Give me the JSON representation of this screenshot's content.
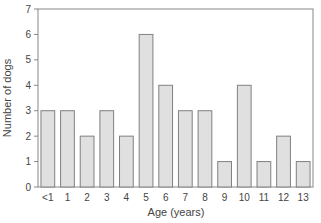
{
  "chart_data": {
    "type": "bar",
    "title": "",
    "xlabel": "Age (years)",
    "ylabel": "Number of dogs",
    "categories": [
      "<1",
      "1",
      "2",
      "3",
      "4",
      "5",
      "6",
      "7",
      "8",
      "9",
      "10",
      "11",
      "12",
      "13"
    ],
    "values": [
      3,
      3,
      2,
      3,
      2,
      6,
      4,
      3,
      3,
      1,
      4,
      1,
      2,
      1
    ],
    "ylim": [
      0,
      7
    ],
    "yticks": [
      0,
      1,
      2,
      3,
      4,
      5,
      6,
      7
    ],
    "grid": false,
    "legend": null,
    "colors": {
      "bar_fill": "#e0e0e0",
      "bar_stroke": "#808080",
      "axis": "#888888"
    }
  }
}
